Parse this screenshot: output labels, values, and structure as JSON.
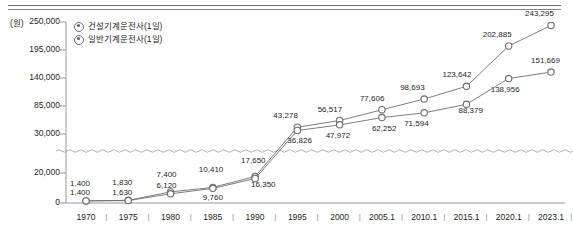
{
  "axis": {
    "unit_label": "(원)",
    "y_ticks": [
      "250,000",
      "195,000",
      "140,000",
      "85,000",
      "30,000",
      "20,000",
      "0"
    ],
    "x_ticks": [
      "1970",
      "1975",
      "1980",
      "1985",
      "1990",
      "1995",
      "2000",
      "2005.1",
      "2010.1",
      "2015.1",
      "2020.1",
      "2023.1"
    ],
    "separator": "|"
  },
  "legend": {
    "items": [
      {
        "label": "건설기계운전사(1일)",
        "marker": "circle-dot-icon"
      },
      {
        "label": "일반기계운전사(1일)",
        "marker": "circle-dot-icon"
      }
    ]
  },
  "colors": {
    "line": "#6f6f6f",
    "marker_stroke": "#6d6d6d",
    "marker_fill": "#ffffff",
    "axis": "#8c8c8c",
    "text": "#231f20"
  },
  "chart_data": {
    "type": "line",
    "title": "",
    "xlabel": "",
    "ylabel": "(원)",
    "grid": false,
    "legend_position": "top-left",
    "axis_break": {
      "between": [
        20000,
        30000
      ],
      "style": "wavy"
    },
    "ylim": [
      0,
      250000
    ],
    "ytick_values": [
      250000,
      195000,
      140000,
      85000,
      30000,
      20000,
      0
    ],
    "categories": [
      "1970",
      "1975",
      "1980",
      "1985",
      "1990",
      "1995",
      "2000",
      "2005.1",
      "2010.1",
      "2015.1",
      "2020.1",
      "2023.1"
    ],
    "series": [
      {
        "name": "건설기계운전사(1일)",
        "values": [
          1400,
          1830,
          7400,
          10410,
          17650,
          43278,
          56517,
          77606,
          98693,
          123642,
          202885,
          243295
        ],
        "labels": [
          "1,400",
          "1,830",
          "7,400",
          "10,410",
          "17,650",
          "43,278",
          "56,517",
          "77,606",
          "98,693",
          "123,642",
          "202,885",
          "243,295"
        ]
      },
      {
        "name": "일반기계운전사(1일)",
        "values": [
          1400,
          1630,
          6120,
          9760,
          16350,
          36826,
          47972,
          62252,
          71594,
          88379,
          138956,
          151669
        ],
        "labels": [
          "1,400",
          "1,630",
          "6,120",
          "9,760",
          "16,350",
          "36,826",
          "47,972",
          "62,252",
          "71,594",
          "88,379",
          "138,956",
          "151,669"
        ]
      }
    ]
  }
}
